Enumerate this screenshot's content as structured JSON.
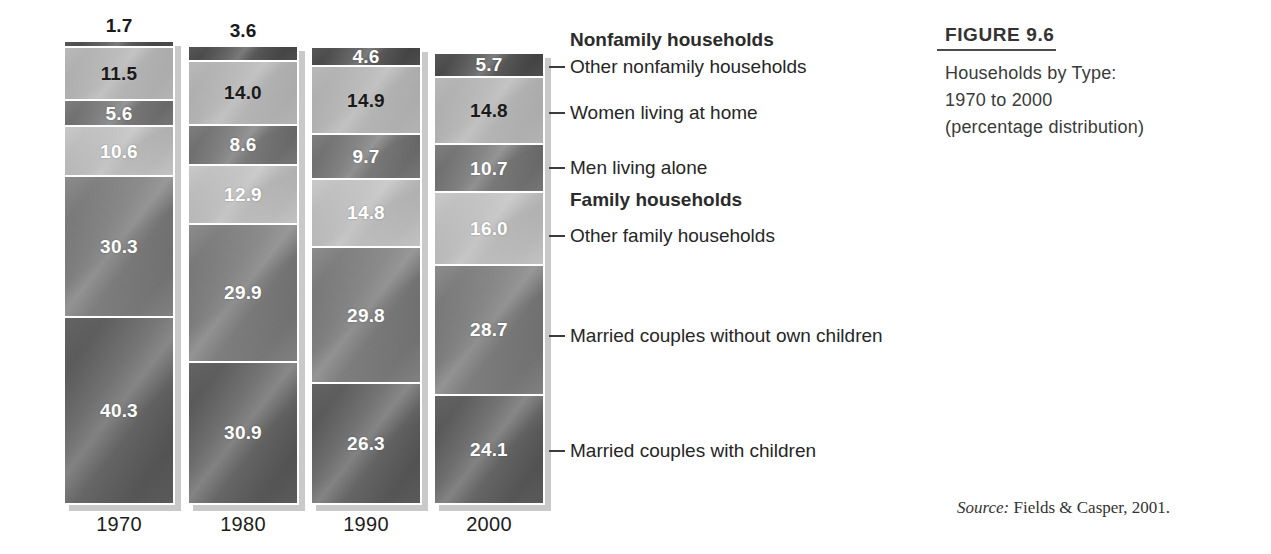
{
  "figure": {
    "number": "FIGURE 9.6",
    "lines": [
      "Households by Type:",
      "1970 to 2000",
      "(percentage distribution)"
    ]
  },
  "source": {
    "prefix": "Source:",
    "text": " Fields & Casper, 2001."
  },
  "legend": {
    "headings": [
      {
        "label": "Nonfamily households"
      },
      {
        "label": "Family households"
      }
    ],
    "items": [
      {
        "label": "Other nonfamily households"
      },
      {
        "label": "Women living at home"
      },
      {
        "label": "Men living alone"
      },
      {
        "label": "Other family households"
      },
      {
        "label": "Married couples without own children"
      },
      {
        "label": "Married couples with children"
      }
    ]
  },
  "chart_data": {
    "type": "bar",
    "subtitle": "",
    "xlabel": "",
    "ylabel": "",
    "ylim": [
      0,
      100
    ],
    "grid": false,
    "legend_position": "right",
    "stacked": true,
    "categories": [
      "1970",
      "1980",
      "1990",
      "2000"
    ],
    "series": [
      {
        "name": "Other nonfamily households",
        "values": [
          1.7,
          3.6,
          4.6,
          5.7
        ]
      },
      {
        "name": "Women living at home",
        "values": [
          11.5,
          14.0,
          14.9,
          14.8
        ]
      },
      {
        "name": "Men living alone",
        "values": [
          5.6,
          8.6,
          9.7,
          10.7
        ]
      },
      {
        "name": "Other family households",
        "values": [
          10.6,
          12.9,
          14.8,
          16.0
        ]
      },
      {
        "name": "Married couples without own children",
        "values": [
          30.3,
          29.9,
          29.8,
          28.7
        ]
      },
      {
        "name": "Married couples with children",
        "values": [
          40.3,
          30.9,
          26.3,
          24.1
        ]
      }
    ],
    "value_labels": {
      "1970": [
        "1.7",
        "11.5",
        "5.6",
        "10.6",
        "30.3",
        "40.3"
      ],
      "1980": [
        "3.6",
        "14.0",
        "8.6",
        "12.9",
        "29.9",
        "30.9"
      ],
      "1990": [
        "4.6",
        "14.9",
        "9.7",
        "14.8",
        "29.8",
        "26.3"
      ],
      "2000": [
        "5.7",
        "14.8",
        "10.7",
        "16.0",
        "28.7",
        "24.1"
      ]
    }
  },
  "colors": {
    "series_0": "#454545",
    "series_1": "#afafaf",
    "series_2": "#6d6d6d",
    "series_3": "#bcbcbc",
    "series_4": "#6f6f6f",
    "series_5": "#545454",
    "label_dark": "#1a1a1a",
    "label_light": "#ffffff",
    "text": "#262626"
  }
}
